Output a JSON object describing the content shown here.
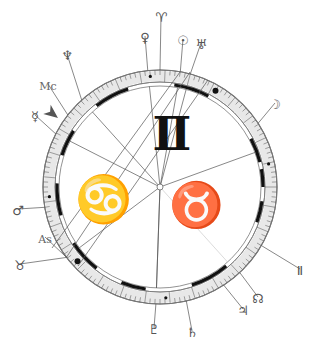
{
  "chart": {
    "center": {
      "x": 160,
      "y": 187
    },
    "radii": {
      "outer": 117,
      "tick_inner": 105,
      "band": 101,
      "arc": 103
    },
    "colors": {
      "ring": "#777777",
      "line": "#555555",
      "arc": "#111111",
      "glyph": "#555555",
      "sign": "#111111"
    },
    "big_signs": [
      {
        "name": "gemini",
        "glyph": "Ⅱ",
        "x": 172,
        "y": 150,
        "size": 46
      },
      {
        "name": "cancer",
        "glyph": "♋",
        "x": 103,
        "y": 215,
        "size": 46
      },
      {
        "name": "taurus",
        "glyph": "♉",
        "x": 196,
        "y": 220,
        "size": 44
      }
    ],
    "points": [
      {
        "name": "aries-cusp",
        "glyph": "♈",
        "angle": 90,
        "label_x": 161,
        "label_y": 22,
        "line_to_center": false
      },
      {
        "name": "venus",
        "glyph": "♀",
        "angle": 96,
        "label_x": 145,
        "label_y": 42,
        "line_to_center": true
      },
      {
        "name": "sun",
        "glyph": "☉",
        "angle": 80,
        "label_x": 183,
        "label_y": 45,
        "line_to_center": true
      },
      {
        "name": "uranus",
        "glyph": "♅",
        "angle": 75,
        "label_x": 201,
        "label_y": 49,
        "line_to_center": true
      },
      {
        "name": "neptune",
        "glyph": "♆",
        "angle": 132,
        "label_x": 67,
        "label_y": 60,
        "line_to_center": true
      },
      {
        "name": "midheaven",
        "glyph": "Mc",
        "angle": 142,
        "label_x": 48,
        "label_y": 90,
        "line_to_center": false
      },
      {
        "name": "mercury",
        "glyph": "☿",
        "angle": 153,
        "label_x": 35,
        "label_y": 121,
        "line_to_center": true
      },
      {
        "name": "moon",
        "glyph": "☽",
        "angle": 33,
        "label_x": 275,
        "label_y": 109,
        "line_to_center": false
      },
      {
        "name": "mars",
        "glyph": "♂",
        "angle": 190,
        "label_x": 18,
        "label_y": 215,
        "line_to_center": false
      },
      {
        "name": "ascendant",
        "glyph": "As",
        "angle": 217,
        "label_x": 45,
        "label_y": 243,
        "line_to_center": true
      },
      {
        "name": "taurus-cusp",
        "glyph": "♉",
        "angle": 217,
        "label_x": 20,
        "label_y": 270,
        "line_to_center": false
      },
      {
        "name": "pluto",
        "glyph": "♇",
        "angle": 268,
        "label_x": 154,
        "label_y": 334,
        "line_to_center": true
      },
      {
        "name": "saturn",
        "glyph": "♄",
        "angle": 283,
        "label_x": 192,
        "label_y": 337,
        "line_to_center": false
      },
      {
        "name": "jupiter",
        "glyph": "♃",
        "angle": 303,
        "label_x": 243,
        "label_y": 315,
        "line_to_center": false
      },
      {
        "name": "node",
        "glyph": "☊",
        "angle": 313,
        "label_x": 258,
        "label_y": 303,
        "line_to_center": false
      },
      {
        "name": "gemini-cusp",
        "glyph": "Ⅱ",
        "angle": 330,
        "label_x": 300,
        "label_y": 275,
        "line_to_center": false
      }
    ],
    "house_lines": [
      {
        "from_angle": 20,
        "note": "right house cusp"
      },
      {
        "from_angle": 268,
        "note": "pluto line"
      }
    ],
    "thick_arcs": [
      [
        108,
        128
      ],
      [
        62,
        82
      ],
      [
        147,
        162
      ],
      [
        178,
        196
      ],
      [
        213,
        232
      ],
      [
        248,
        262
      ],
      [
        288,
        310
      ],
      [
        0,
        10
      ],
      [
        14,
        28
      ],
      [
        340,
        352
      ]
    ],
    "dots": [
      {
        "angle": 95,
        "r": 111,
        "size": 1.6
      },
      {
        "angle": 60,
        "r": 111,
        "size": 3
      },
      {
        "angle": 222,
        "r": 111,
        "size": 3
      },
      {
        "angle": 273,
        "r": 111,
        "size": 1.6
      },
      {
        "angle": 185,
        "r": 111,
        "size": 1.6
      },
      {
        "angle": 12,
        "r": 111,
        "size": 1.6
      }
    ],
    "cross_lines": [
      {
        "x1": 66,
        "y1": 258,
        "x2": 190,
        "y2": 72
      },
      {
        "x1": 78,
        "y1": 266,
        "x2": 208,
        "y2": 80
      },
      {
        "x1": 52,
        "y1": 248,
        "x2": 180,
        "y2": 72
      }
    ],
    "mc_arrow": {
      "x": 58,
      "y": 118,
      "angle": 142
    }
  }
}
